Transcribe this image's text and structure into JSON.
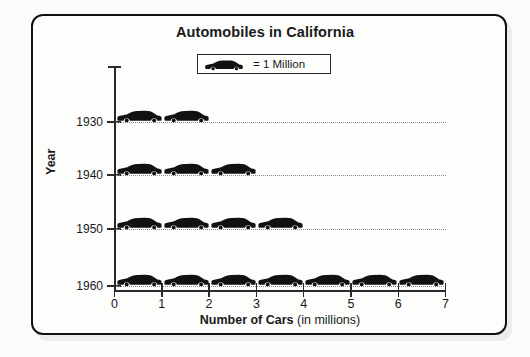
{
  "figure": {
    "title": "Automobiles in California",
    "legend": {
      "icon": "car-icon",
      "text": "= 1 Million"
    },
    "y_axis_title": "Year",
    "x_axis_title_bold": "Number of Cars",
    "x_axis_title_rest": " (in millions)"
  },
  "chart_data": {
    "type": "bar",
    "subtype": "pictograph",
    "title": "Automobiles in California",
    "xlabel": "Number of Cars (in millions)",
    "ylabel": "Year",
    "orientation": "horizontal",
    "unit_symbol": "car-icon",
    "unit_value": 1,
    "unit_label": "= 1 Million",
    "categories": [
      "1930",
      "1940",
      "1950",
      "1960"
    ],
    "values": [
      2,
      3,
      4,
      7
    ],
    "icon_counts": [
      2,
      3,
      4,
      7
    ],
    "xlim": [
      0,
      7
    ],
    "xticks": [
      "0",
      "1",
      "2",
      "3",
      "4",
      "5",
      "6",
      "7"
    ],
    "yticks": [
      "1930",
      "1940",
      "1950",
      "1960"
    ],
    "grid": "horizontal-dotted",
    "legend_position": "top-center"
  },
  "colors": {
    "icon": "#111111",
    "frame": "#111111",
    "axis": "#2a2a2a",
    "grid": "#8e8e8e",
    "background": "#fdfdfc"
  }
}
